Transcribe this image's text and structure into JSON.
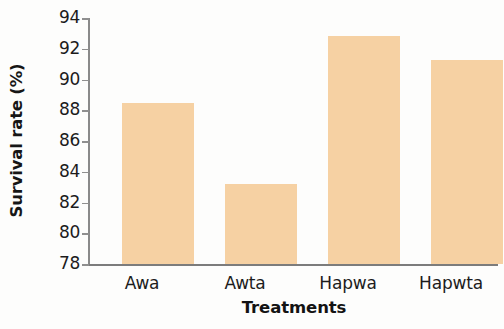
{
  "chart_data": {
    "type": "bar",
    "title": "",
    "xlabel": "Treatments",
    "ylabel": "Survival rate (%)",
    "categories": [
      "Awa",
      "Awta",
      "Hapwa",
      "Hapwta"
    ],
    "values": [
      88.5,
      83.2,
      92.8,
      91.3
    ],
    "ylim": [
      78,
      94
    ],
    "ytick_labels": [
      "78",
      "80",
      "82",
      "84",
      "86",
      "88",
      "90",
      "92",
      "94"
    ],
    "ytick_values": [
      78,
      80,
      82,
      84,
      86,
      88,
      90,
      92,
      94
    ],
    "ytick_step": 2,
    "grid": false,
    "legend": false,
    "bar_color": "#f6d1a3",
    "axis_color": "#8a8a8a",
    "background_color": "#fdfdfc"
  }
}
